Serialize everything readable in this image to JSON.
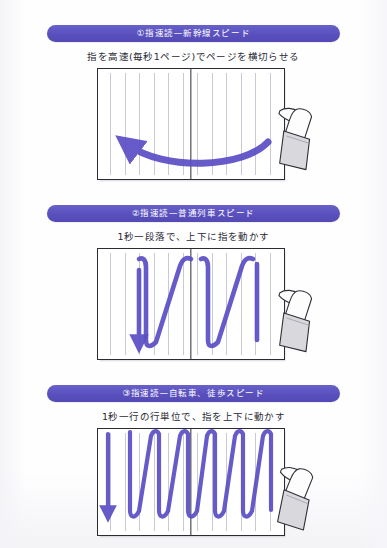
{
  "page": {
    "top_cropped_text": "",
    "background_color": "#ffffff",
    "accent_color": "#5a50bd",
    "ink_color": "#5b4fc4",
    "line_color": "#2b2b33"
  },
  "sections": [
    {
      "id": "section-1",
      "banner_label": "①指速読—新幹線スピード",
      "caption": "指を高速(毎秒1ページ)でページを横切らせる",
      "diagram": {
        "type": "sweeping-curve",
        "stroke_count": 1,
        "description": "single wide U-shaped sweep across both pages, arrow head at upper-left",
        "text_line_count": 12
      },
      "hand_icon": "pointing-hand-icon"
    },
    {
      "id": "section-2",
      "banner_label": "②指速読—普通列車スピード",
      "caption": "1秒一段落で、上下に指を動かす",
      "diagram": {
        "type": "zigzag",
        "stroke_count": 3,
        "description": "three tall N-shaped sweeps, arrow head at bottom-left",
        "text_line_count": 12
      },
      "hand_icon": "pointing-hand-icon"
    },
    {
      "id": "section-3",
      "banner_label": "③指速読—自転車、徒歩スピード",
      "caption": "1秒一行の行単位で、指を上下に動かす",
      "diagram": {
        "type": "zigzag",
        "stroke_count": 9,
        "description": "nine narrow N-shaped sweeps, arrow head at bottom-left",
        "text_line_count": 12
      },
      "hand_icon": "pointing-hand-icon"
    }
  ]
}
